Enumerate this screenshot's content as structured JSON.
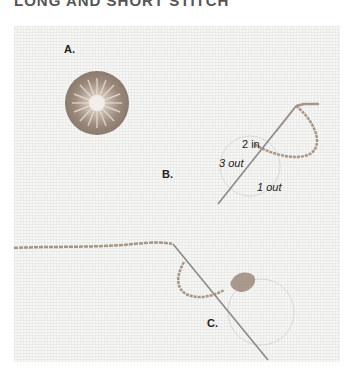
{
  "heading": "LONG AND SHORT STITCH",
  "steps": {
    "a": {
      "label": "A."
    },
    "b": {
      "label": "B.",
      "annotations": {
        "in2": "2 in",
        "out3": "3 out",
        "out1": "1 out"
      }
    },
    "c": {
      "label": "C."
    }
  },
  "colors": {
    "background": "#f6f6f4",
    "thread": "#a89684",
    "thread_dark": "#7d6e62",
    "needle": "#8a8a8a",
    "circle_outline": "#d8d8d8"
  }
}
